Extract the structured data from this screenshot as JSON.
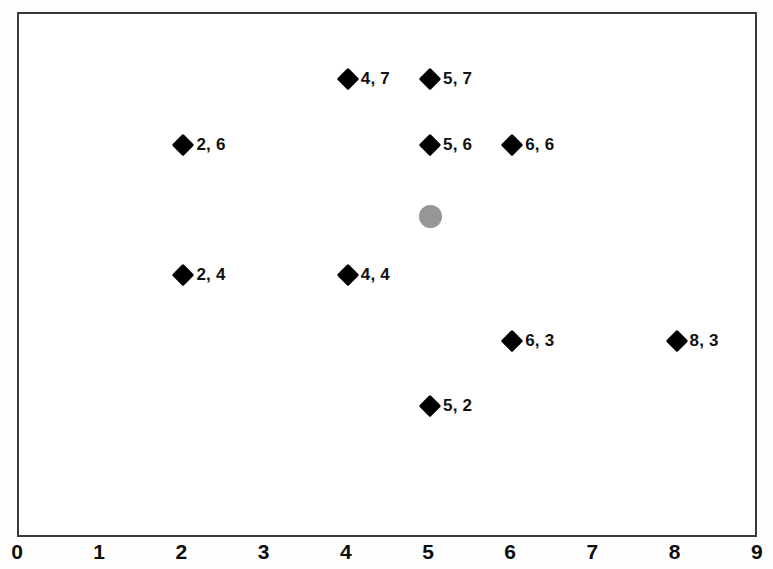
{
  "chart_data": {
    "type": "scatter",
    "title": "",
    "xlabel": "",
    "ylabel": "",
    "xlim": [
      0,
      9
    ],
    "ylim": [
      0,
      8
    ],
    "grid": false,
    "legend": null,
    "x_ticks": [
      "0",
      "1",
      "2",
      "3",
      "4",
      "5",
      "6",
      "7",
      "8",
      "9"
    ],
    "y_ticks": [],
    "series": [
      {
        "name": "labeled-points",
        "marker": "diamond",
        "color": "#000000",
        "points": [
          {
            "x": 4,
            "y": 7,
            "label": "4, 7"
          },
          {
            "x": 5,
            "y": 7,
            "label": "5, 7"
          },
          {
            "x": 2,
            "y": 6,
            "label": "2, 6"
          },
          {
            "x": 5,
            "y": 6,
            "label": "5, 6"
          },
          {
            "x": 6,
            "y": 6,
            "label": "6, 6"
          },
          {
            "x": 2,
            "y": 4,
            "label": "2, 4"
          },
          {
            "x": 4,
            "y": 4,
            "label": "4, 4"
          },
          {
            "x": 6,
            "y": 3,
            "label": "6, 3"
          },
          {
            "x": 8,
            "y": 3,
            "label": "8, 3"
          },
          {
            "x": 5,
            "y": 2,
            "label": "5, 2"
          }
        ]
      },
      {
        "name": "highlighted-point",
        "marker": "circle",
        "color": "#969696",
        "points": [
          {
            "x": 5,
            "y": 4.9,
            "label": ""
          }
        ]
      }
    ]
  },
  "axis": {
    "frame_color": "#3a3a3a",
    "label_color": "#0d0d0d"
  }
}
